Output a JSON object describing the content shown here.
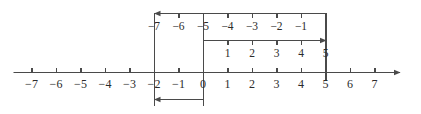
{
  "figure": {
    "name": "number-line-addition-diagram",
    "stroke_color": "#4a4a4a",
    "text_color": "#2b2b2b",
    "background": "#ffffff"
  },
  "geometry": {
    "origin_x": 203,
    "unit_px": 24.5,
    "axis_y": 72,
    "top_row_y": 13,
    "middle_row_y": 40,
    "bottom_row_y": 99
  },
  "axis": {
    "name": "main-number-line",
    "min": -7,
    "max": 7,
    "arrow_end": "right",
    "ticks": [
      {
        "value": -7,
        "label": "−7"
      },
      {
        "value": -6,
        "label": "−6"
      },
      {
        "value": -5,
        "label": "−5"
      },
      {
        "value": -4,
        "label": "−4"
      },
      {
        "value": -3,
        "label": "−3"
      },
      {
        "value": -2,
        "label": "−2"
      },
      {
        "value": -1,
        "label": "−1"
      },
      {
        "value": 0,
        "label": "0"
      },
      {
        "value": 1,
        "label": "1"
      },
      {
        "value": 2,
        "label": "2"
      },
      {
        "value": 3,
        "label": "3"
      },
      {
        "value": 4,
        "label": "4"
      },
      {
        "value": 5,
        "label": "5"
      },
      {
        "value": 6,
        "label": "6"
      },
      {
        "value": 7,
        "label": "7"
      }
    ]
  },
  "top_scale": {
    "name": "top-negative-scale",
    "from_value": 5,
    "to_value": -2,
    "arrow_direction": "left",
    "ticks": [
      {
        "at": -2,
        "label": "−7"
      },
      {
        "at": -1,
        "label": "−6"
      },
      {
        "at": 0,
        "label": "−5"
      },
      {
        "at": 1,
        "label": "−4"
      },
      {
        "at": 2,
        "label": "−3"
      },
      {
        "at": 3,
        "label": "−2"
      },
      {
        "at": 4,
        "label": "−1"
      },
      {
        "at": 5,
        "label": ""
      }
    ]
  },
  "middle_scale": {
    "name": "middle-positive-scale",
    "from_value": 0,
    "to_value": 5,
    "arrow_direction": "right",
    "ticks": [
      {
        "at": 0,
        "label": ""
      },
      {
        "at": 1,
        "label": "1"
      },
      {
        "at": 2,
        "label": "2"
      },
      {
        "at": 3,
        "label": "3"
      },
      {
        "at": 4,
        "label": "4"
      },
      {
        "at": 5,
        "label": "5"
      }
    ]
  },
  "bottom_jump": {
    "name": "bottom-result-arrow",
    "from_value": 0,
    "to_value": -2,
    "arrow_direction": "left",
    "label": ""
  },
  "connectors": [
    {
      "name": "connector-at-minus-2",
      "value": -2,
      "from_y": 13,
      "to_y": 105
    },
    {
      "name": "connector-at-zero",
      "value": 0,
      "from_y": 13,
      "to_y": 105
    },
    {
      "name": "connector-at-five",
      "value": 5,
      "from_y": 13,
      "to_y": 80
    }
  ]
}
